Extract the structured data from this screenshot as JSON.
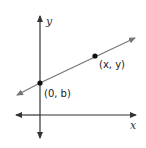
{
  "diagram": {
    "axes": {
      "x_label": "x",
      "y_label": "y",
      "axis_color": "#333333"
    },
    "line": {
      "color": "#777777",
      "description": "line with positive slope"
    },
    "points": [
      {
        "label": "(0, b)",
        "x": 40,
        "y": 83
      },
      {
        "label": "(x, y)",
        "x": 95,
        "y": 55
      }
    ]
  }
}
